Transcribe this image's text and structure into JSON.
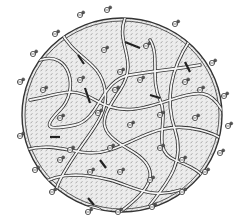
{
  "figure": {
    "type": "schematic",
    "colors": {
      "background": "#ffffff",
      "fill": "#e4e4e4",
      "stroke": "#333333",
      "strand_fill": "#ffffff",
      "hatch": "#777777"
    }
  }
}
